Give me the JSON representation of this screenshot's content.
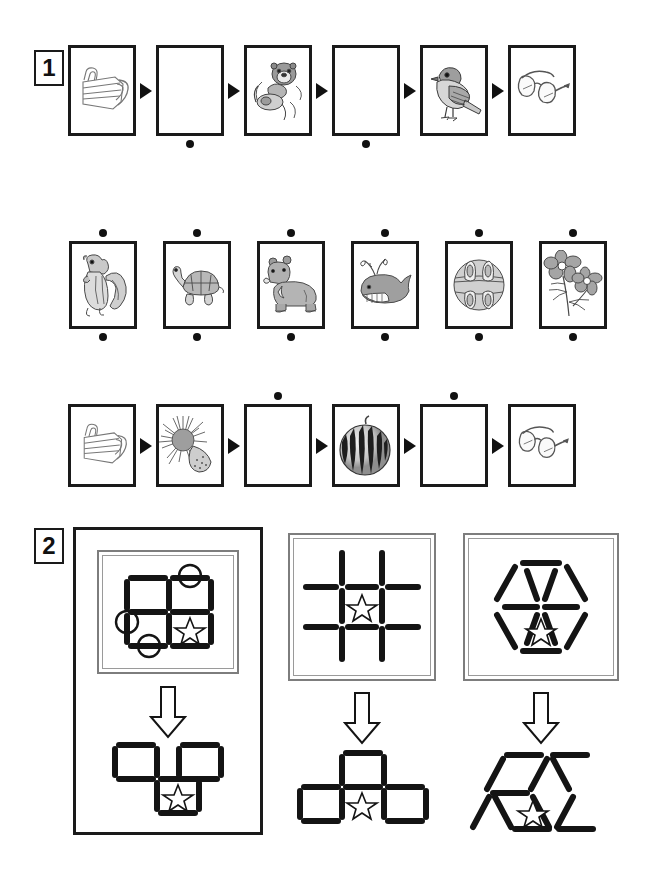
{
  "worksheet": {
    "sections": [
      {
        "number": "1",
        "name": "picture-sequence-section",
        "rows": [
          {
            "name": "sequence-row-1",
            "connector": "arrow",
            "cards": [
              {
                "icon": "face-mask-icon",
                "label": "face mask",
                "empty": false,
                "dot": "none"
              },
              {
                "icon": "blank-icon",
                "label": "blank",
                "empty": true,
                "dot": "below"
              },
              {
                "icon": "sea-otter-icon",
                "label": "sea otter",
                "empty": false,
                "dot": "none"
              },
              {
                "icon": "blank-icon",
                "label": "blank",
                "empty": true,
                "dot": "below"
              },
              {
                "icon": "sparrow-icon",
                "label": "sparrow",
                "empty": false,
                "dot": "none"
              },
              {
                "icon": "eyeglasses-icon",
                "label": "eyeglasses",
                "empty": false,
                "dot": "none"
              }
            ]
          },
          {
            "name": "sequence-row-2",
            "connector": "none",
            "cards": [
              {
                "icon": "chipmunk-icon",
                "label": "chipmunk",
                "empty": false,
                "dot": "both"
              },
              {
                "icon": "turtle-icon",
                "label": "turtle",
                "empty": false,
                "dot": "both"
              },
              {
                "icon": "bear-icon",
                "label": "bear",
                "empty": false,
                "dot": "both"
              },
              {
                "icon": "whale-icon",
                "label": "whale",
                "empty": false,
                "dot": "both"
              },
              {
                "icon": "ornament-icon",
                "label": "ornament",
                "empty": false,
                "dot": "both"
              },
              {
                "icon": "flower-icon",
                "label": "flowers",
                "empty": false,
                "dot": "both"
              }
            ]
          },
          {
            "name": "sequence-row-3",
            "connector": "arrow",
            "cards": [
              {
                "icon": "face-mask-icon",
                "label": "face mask",
                "empty": false,
                "dot": "none"
              },
              {
                "icon": "sea-urchin-icon",
                "label": "sea urchin",
                "empty": false,
                "dot": "none"
              },
              {
                "icon": "blank-icon",
                "label": "blank",
                "empty": true,
                "dot": "above"
              },
              {
                "icon": "watermelon-icon",
                "label": "watermelon",
                "empty": false,
                "dot": "none"
              },
              {
                "icon": "blank-icon",
                "label": "blank",
                "empty": true,
                "dot": "above"
              },
              {
                "icon": "eyeglasses-icon",
                "label": "eyeglasses",
                "empty": false,
                "dot": "none"
              }
            ]
          }
        ]
      },
      {
        "number": "2",
        "name": "matchstick-puzzle-section",
        "panels": [
          {
            "name": "matchstick-panel-1",
            "outlined": true,
            "input": {
              "name": "matchstick-grid-2x2",
              "description": "two by two square grid of matchsticks",
              "marked_sticks": 3,
              "star_cell": "bottom-right"
            },
            "connector": "down-arrow-icon",
            "output": {
              "name": "matchstick-result-1",
              "description": "two top squares and one bottom middle square",
              "star_cell": "bottom-middle"
            }
          },
          {
            "name": "matchstick-panel-2",
            "outlined": false,
            "input": {
              "name": "matchstick-hash-grid",
              "description": "tic tac toe hash of matchsticks",
              "marked_sticks": 0,
              "star_cell": "center"
            },
            "connector": "down-arrow-icon",
            "output": {
              "name": "matchstick-result-2",
              "description": "top middle square with left and right squares below",
              "star_cell": "bottom-middle"
            }
          },
          {
            "name": "matchstick-panel-3",
            "outlined": false,
            "input": {
              "name": "matchstick-hexagon",
              "description": "hexagon split into six triangles",
              "marked_sticks": 0,
              "star_cell": "bottom-center-triangle"
            },
            "connector": "down-arrow-icon",
            "output": {
              "name": "matchstick-result-3",
              "description": "scattered triangle arrangement",
              "star_cell": "center"
            }
          }
        ]
      }
    ]
  }
}
